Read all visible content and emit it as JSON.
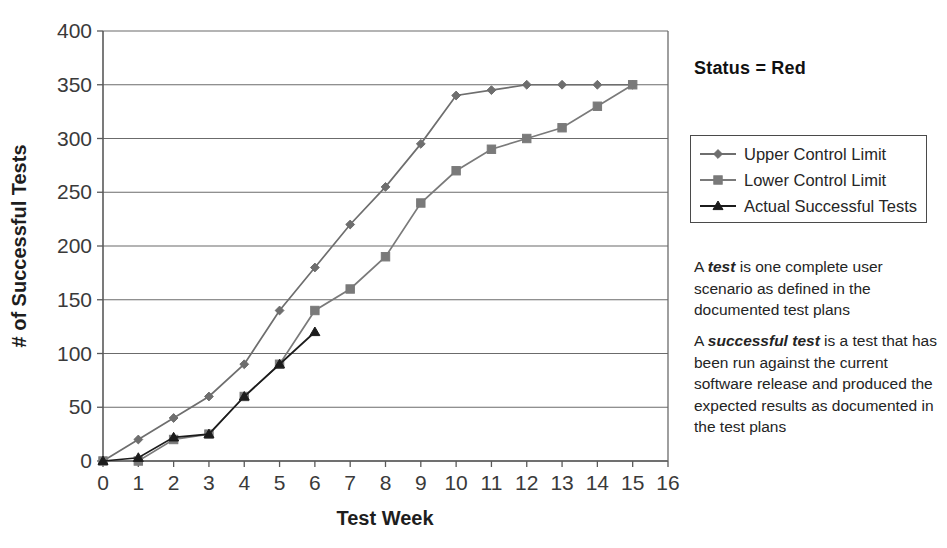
{
  "chart_data": {
    "type": "line",
    "title": "",
    "xlabel": "Test Week",
    "ylabel": "# of Successful Tests",
    "xlim": [
      0,
      16
    ],
    "ylim": [
      0,
      400
    ],
    "ytick_step": 50,
    "xtick_step": 1,
    "grid": "horizontal",
    "legend_position": "right",
    "x": [
      0,
      1,
      2,
      3,
      4,
      5,
      6,
      7,
      8,
      9,
      10,
      11,
      12,
      13,
      14,
      15
    ],
    "xticks": [
      "0",
      "1",
      "2",
      "3",
      "4",
      "5",
      "6",
      "7",
      "8",
      "9",
      "10",
      "11",
      "12",
      "13",
      "14",
      "15",
      "16"
    ],
    "yticks": [
      "0",
      "50",
      "100",
      "150",
      "200",
      "250",
      "300",
      "350",
      "400"
    ],
    "series": [
      {
        "name": "Upper Control Limit",
        "marker": "diamond",
        "color": "#6e6e6e",
        "values": [
          0,
          20,
          40,
          60,
          90,
          140,
          180,
          220,
          255,
          295,
          340,
          345,
          350,
          350,
          350,
          350
        ]
      },
      {
        "name": "Lower Control Limit",
        "marker": "square",
        "color": "#7a7a7a",
        "values": [
          0,
          0,
          20,
          25,
          60,
          90,
          140,
          160,
          190,
          240,
          270,
          290,
          300,
          310,
          330,
          350
        ]
      },
      {
        "name": "Actual Successful Tests",
        "marker": "triangle",
        "color": "#1c1c1c",
        "values": [
          0,
          3,
          22,
          25,
          60,
          90,
          120,
          null,
          null,
          null,
          null,
          null,
          null,
          null,
          null,
          null
        ]
      }
    ]
  },
  "status": {
    "label": "Status = Red"
  },
  "legend": {
    "items": [
      {
        "label": "Upper Control Limit"
      },
      {
        "label": "Lower Control Limit"
      },
      {
        "label": "Actual Successful Tests"
      }
    ]
  },
  "notes": [
    {
      "lead": "A ",
      "emphasis": "test",
      "body": " is one complete user scenario as defined in the documented test plans"
    },
    {
      "lead": "A ",
      "emphasis": "successful test",
      "body": " is a test that has been run against the current software release and produced the expected results as documented in the test plans"
    }
  ]
}
